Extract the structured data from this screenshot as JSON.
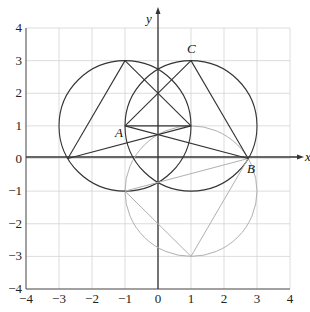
{
  "figure": {
    "x_axis_label": "x",
    "y_axis_label": "y",
    "x_range": [
      -4,
      4
    ],
    "y_range": [
      -4,
      4
    ],
    "x_ticks": [
      "−4",
      "−3",
      "−2",
      "−1",
      "0",
      "1",
      "2",
      "3",
      "4"
    ],
    "y_ticks": [
      "4",
      "3",
      "2",
      "1",
      "0",
      "−1",
      "−2",
      "−3",
      "−4"
    ],
    "grid": true,
    "colors": {
      "grid": "#d4d4d4",
      "axis": "#333333",
      "dark_stroke": "#333333",
      "light_stroke": "#b0b0b0"
    }
  },
  "points": [
    {
      "label": "A",
      "x": -1,
      "y": 1
    },
    {
      "label": "B",
      "x": 2.732,
      "y": 0
    },
    {
      "label": "C",
      "x": 1,
      "y": 3
    }
  ],
  "circles": [
    {
      "name": "left-circle",
      "cx": -1,
      "cy": 1,
      "r": 2,
      "style": "dark"
    },
    {
      "name": "right-circle",
      "cx": 1,
      "cy": 1,
      "r": 2,
      "style": "dark"
    },
    {
      "name": "lower-circle",
      "cx": 1,
      "cy": -1,
      "r": 2,
      "style": "light"
    }
  ],
  "segments": [
    {
      "from": [
        -2.732,
        0
      ],
      "to": [
        -1,
        3
      ],
      "style": "dark"
    },
    {
      "from": [
        -1,
        3
      ],
      "to": [
        1,
        1
      ],
      "style": "dark"
    },
    {
      "from": [
        -2.732,
        0
      ],
      "to": [
        1,
        1
      ],
      "style": "dark"
    },
    {
      "from": [
        -1,
        1
      ],
      "to": [
        1,
        3
      ],
      "style": "dark"
    },
    {
      "from": [
        1,
        3
      ],
      "to": [
        2.732,
        0
      ],
      "style": "dark"
    },
    {
      "from": [
        -1,
        1
      ],
      "to": [
        2.732,
        0
      ],
      "style": "dark"
    },
    {
      "from": [
        -1,
        1
      ],
      "to": [
        1,
        1
      ],
      "style": "dark"
    },
    {
      "from": [
        -1,
        -1
      ],
      "to": [
        1,
        -3
      ],
      "style": "light"
    },
    {
      "from": [
        1,
        -3
      ],
      "to": [
        2.732,
        0
      ],
      "style": "light"
    },
    {
      "from": [
        -1,
        -1
      ],
      "to": [
        2.732,
        0
      ],
      "style": "light"
    }
  ]
}
